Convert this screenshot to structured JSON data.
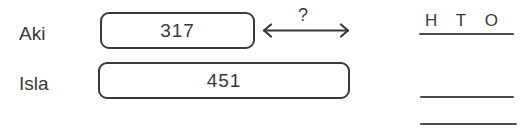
{
  "worksheet": {
    "bar_model": {
      "rows": [
        {
          "name": "Aki",
          "value": "317"
        },
        {
          "name": "Isla",
          "value": "451"
        }
      ],
      "difference": {
        "label": "?",
        "icon": "double-headed-arrow"
      }
    },
    "place_value_header": {
      "columns": [
        {
          "label": "H"
        },
        {
          "label": "T"
        },
        {
          "label": "O"
        }
      ],
      "answer_lines": 2
    },
    "colors": {
      "ink": "#3a3a3a",
      "rule": "#4b4b4b",
      "background": "#ffffff"
    }
  }
}
